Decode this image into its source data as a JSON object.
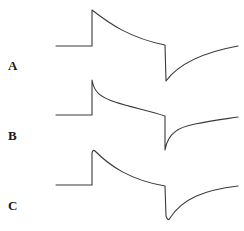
{
  "figure": {
    "panels": [
      {
        "label": "A",
        "description": "Step response with exponential decay during pulse, sharp negative undershoot at pulse end, exponential recovery",
        "baseline_y": 46,
        "peak_y": 10,
        "trough_y": 81
      },
      {
        "label": "B",
        "description": "Step response with fast initial decay then slow sag, sharp negative undershoot with fast-then-slow recovery",
        "baseline_y": 115,
        "peak_y": 80,
        "trough_y": 150
      },
      {
        "label": "C",
        "description": "Step response with rounded peak and exponential decay, rounded negative undershoot, exponential recovery",
        "baseline_y": 185,
        "peak_y": 150,
        "trough_y": 221
      }
    ],
    "stroke_color": "#3a3a3a",
    "label_color": "#1a1a1a"
  }
}
